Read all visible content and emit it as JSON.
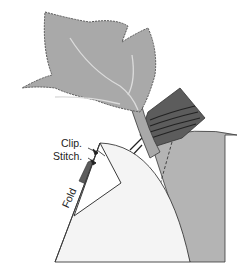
{
  "diagram": {
    "labels": {
      "clip": "Clip.",
      "stitch": "Stitch.",
      "fold": "Fold"
    },
    "colors": {
      "leaf_fill": "#a9a9a9",
      "leaf_vein": "#d9d9d9",
      "stitch_line": "#555555",
      "dark_fabric": "#5c5c5c",
      "stripe_line": "#222222",
      "right_circle": "#b4b4b4",
      "fold_piece": "#f4f4f4",
      "outline": "#3a3a3a",
      "background": "#ffffff"
    }
  }
}
